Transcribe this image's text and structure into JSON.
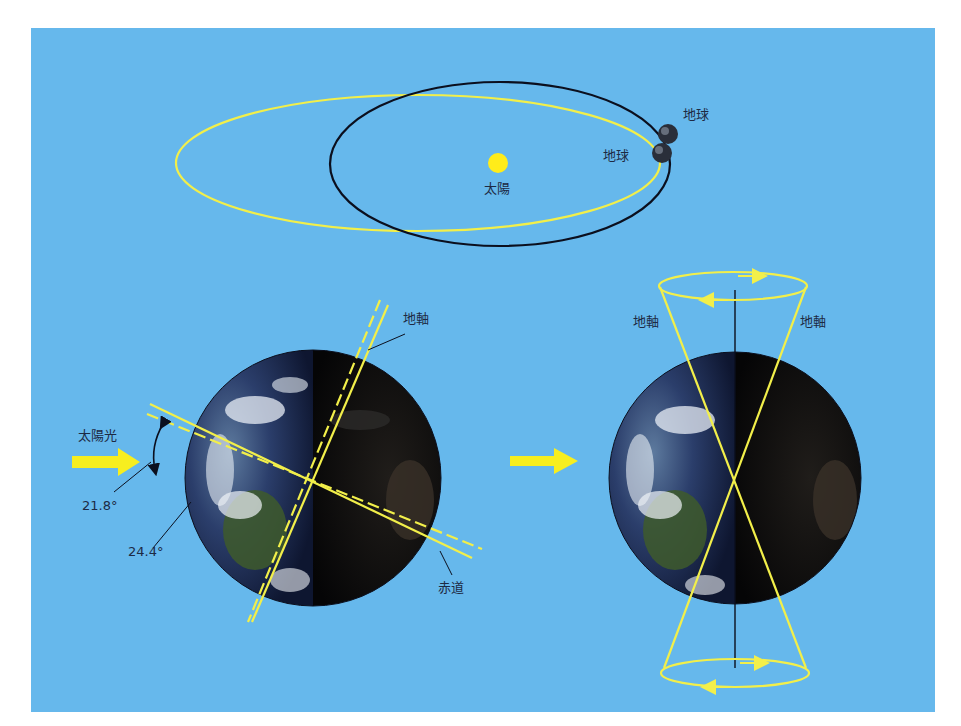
{
  "colors": {
    "background": "#66b8ec",
    "frame": "#ffffff",
    "orbit_yellow": "#f2ef4a",
    "orbit_black": "#0b0f1e",
    "sun": "#ffec1a",
    "arrow": "#f7ee1f",
    "label": "#1d2a44",
    "earth_day": "#2a3c6a",
    "earth_night": "#0a0c10"
  },
  "top_panel": {
    "sun_label": "太陽",
    "earth_label_outer": "地球",
    "earth_label_inner": "地球"
  },
  "left_panel": {
    "sunlight_label": "太陽光",
    "angle_1": "21.8°",
    "angle_2": "24.4°",
    "axis_label": "地軸",
    "equator_label": "赤道"
  },
  "right_panel": {
    "axis_label_left": "地軸",
    "axis_label_right": "地軸"
  }
}
